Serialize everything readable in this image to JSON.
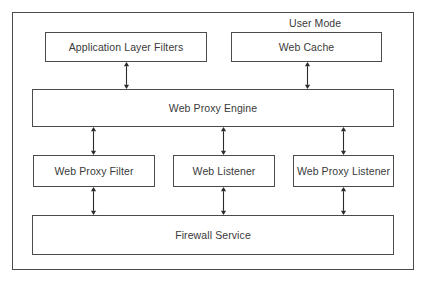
{
  "diagram": {
    "zone": {
      "label": "User Mode"
    },
    "colors": {
      "stroke": "#4b4b4b",
      "text": "#3a3a3a",
      "background": "#ffffff",
      "arrow": "#2b2b2b"
    },
    "nodes": [
      {
        "id": "application-layer-filters",
        "label": "Application Layer Filters",
        "x": 45,
        "y": 32,
        "w": 162,
        "h": 30
      },
      {
        "id": "web-cache",
        "label": "Web Cache",
        "x": 231,
        "y": 32,
        "w": 151,
        "h": 30
      },
      {
        "id": "web-proxy-engine",
        "label": "Web Proxy Engine",
        "x": 32,
        "y": 89,
        "w": 362,
        "h": 38
      },
      {
        "id": "web-proxy-filter",
        "label": "Web Proxy Filter",
        "x": 33,
        "y": 155,
        "w": 122,
        "h": 32
      },
      {
        "id": "web-listener",
        "label": "Web Listener",
        "x": 173,
        "y": 155,
        "w": 102,
        "h": 32
      },
      {
        "id": "web-proxy-listener",
        "label": "Web Proxy Listener",
        "x": 293,
        "y": 155,
        "w": 101,
        "h": 32
      },
      {
        "id": "firewall-service",
        "label": "Firewall Service",
        "x": 32,
        "y": 215,
        "w": 362,
        "h": 40
      }
    ],
    "connectors": [
      {
        "id": "application-layer-filters-to-web-proxy-engine",
        "from": "application-layer-filters",
        "to": "web-proxy-engine",
        "x": 126,
        "y1": 62,
        "y2": 89,
        "bidirectional": true
      },
      {
        "id": "web-cache-to-web-proxy-engine",
        "from": "web-cache",
        "to": "web-proxy-engine",
        "x": 307,
        "y1": 62,
        "y2": 89,
        "bidirectional": true
      },
      {
        "id": "web-proxy-engine-to-web-proxy-filter",
        "from": "web-proxy-engine",
        "to": "web-proxy-filter",
        "x": 93,
        "y1": 127,
        "y2": 155,
        "bidirectional": true
      },
      {
        "id": "web-proxy-engine-to-web-listener",
        "from": "web-proxy-engine",
        "to": "web-listener",
        "x": 223,
        "y1": 127,
        "y2": 155,
        "bidirectional": true
      },
      {
        "id": "web-proxy-engine-to-web-proxy-listener",
        "from": "web-proxy-engine",
        "to": "web-proxy-listener",
        "x": 343,
        "y1": 127,
        "y2": 155,
        "bidirectional": true
      },
      {
        "id": "web-proxy-filter-to-firewall-service",
        "from": "web-proxy-filter",
        "to": "firewall-service",
        "x": 93,
        "y1": 187,
        "y2": 215,
        "bidirectional": true
      },
      {
        "id": "web-listener-to-firewall-service",
        "from": "web-listener",
        "to": "firewall-service",
        "x": 223,
        "y1": 187,
        "y2": 215,
        "bidirectional": true
      },
      {
        "id": "web-proxy-listener-to-firewall-service",
        "from": "web-proxy-listener",
        "to": "firewall-service",
        "x": 343,
        "y1": 187,
        "y2": 215,
        "bidirectional": true
      }
    ]
  }
}
